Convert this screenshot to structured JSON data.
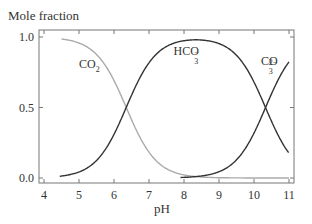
{
  "chart_data": {
    "type": "line",
    "title": "",
    "ylabel": "Mole fraction",
    "xlabel": "pH",
    "xlim": [
      4,
      11
    ],
    "ylim": [
      0,
      1.0
    ],
    "xticks": [
      4,
      5,
      6,
      7,
      8,
      9,
      10,
      11
    ],
    "yticks": [
      0.0,
      0.5,
      1.0
    ],
    "ytick_labels": [
      "0.0",
      "0.5",
      "1.0"
    ],
    "grid": false,
    "legend": "inline labels",
    "x": [
      4.5,
      5.0,
      5.5,
      6.0,
      6.35,
      6.5,
      7.0,
      7.5,
      8.0,
      8.3,
      8.5,
      9.0,
      9.5,
      10.0,
      10.33,
      10.5,
      11.0
    ],
    "series": [
      {
        "name": "CO2",
        "label": "CO",
        "sub": "2",
        "sup": "",
        "color": "#aaaaaa",
        "values": [
          0.986,
          0.957,
          0.876,
          0.691,
          0.5,
          0.415,
          0.183,
          0.066,
          0.022,
          0.011,
          0.007,
          0.002,
          0.001,
          0.0,
          0.0,
          0.0,
          0.0
        ]
      },
      {
        "name": "HCO3-",
        "label": "HCO",
        "sub": "3",
        "sup": "−",
        "color": "#333333",
        "values": [
          0.014,
          0.043,
          0.124,
          0.309,
          0.5,
          0.585,
          0.816,
          0.927,
          0.953,
          0.978,
          0.959,
          0.955,
          0.87,
          0.683,
          0.5,
          0.404,
          0.176
        ]
      },
      {
        "name": "CO3 2-",
        "label": "CO",
        "sub": "3",
        "sup": "2−",
        "color": "#333333",
        "values": [
          0.0,
          0.0,
          0.0,
          0.0,
          0.0,
          0.0,
          0.0,
          0.003,
          0.01,
          0.011,
          0.033,
          0.043,
          0.129,
          0.317,
          0.5,
          0.596,
          0.824
        ]
      }
    ],
    "annotations": [
      {
        "series": "CO2",
        "x": 5.0,
        "y": 0.78
      },
      {
        "series": "HCO3-",
        "x": 7.7,
        "y": 0.87
      },
      {
        "series": "CO3 2-",
        "x": 10.2,
        "y": 0.8
      }
    ]
  }
}
